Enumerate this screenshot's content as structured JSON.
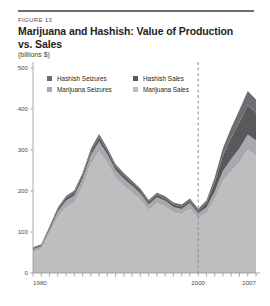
{
  "figure": {
    "label": "FIGURE 13",
    "title": "Marijuana and Hashish: Value of Production vs. Sales",
    "units": "(billions $)"
  },
  "legend": {
    "position": "top-left-inside",
    "items": [
      {
        "label": "Hashish Seizures",
        "color": "#6d6e71"
      },
      {
        "label": "Hashish Sales",
        "color": "#58595b"
      },
      {
        "label": "Marijuana Seizures",
        "color": "#a7a9ac"
      },
      {
        "label": "Marijuana Sales",
        "color": "#bcbec0"
      }
    ]
  },
  "axes": {
    "y_ticks": [
      "500",
      "400",
      "300",
      "200",
      "100",
      "0"
    ],
    "x_ticks": [
      "1980",
      "2000",
      "2007"
    ],
    "y_zero_label": "0"
  },
  "annotations": {
    "divider_year": 2000,
    "divider_style": "dashed"
  },
  "chart_data": {
    "type": "area",
    "title": "Marijuana and Hashish: Value of Production vs. Sales",
    "subtitle": "FIGURE 13",
    "xlabel": "",
    "ylabel": "billions $",
    "ylim": [
      0,
      500
    ],
    "xlim": [
      1980,
      2007
    ],
    "grid": false,
    "stacked": true,
    "legend_position": "top-left",
    "x": [
      1980,
      1981,
      1982,
      1983,
      1984,
      1985,
      1986,
      1987,
      1988,
      1989,
      1990,
      1991,
      1992,
      1993,
      1994,
      1995,
      1996,
      1997,
      1998,
      1999,
      2000,
      2001,
      2002,
      2003,
      2004,
      2005,
      2006,
      2007
    ],
    "series": [
      {
        "name": "Marijuana Sales",
        "color": "#bcbec0",
        "values": [
          52,
          58,
          96,
          137,
          160,
          172,
          211,
          265,
          297,
          268,
          232,
          212,
          196,
          178,
          153,
          170,
          162,
          148,
          143,
          157,
          134,
          146,
          180,
          224,
          248,
          270,
          300,
          287
        ]
      },
      {
        "name": "Marijuana Seizures",
        "color": "#a7a9ac",
        "values": [
          6,
          7,
          10,
          13,
          16,
          17,
          19,
          22,
          24,
          21,
          19,
          18,
          17,
          16,
          14,
          15,
          14,
          13,
          13,
          14,
          12,
          14,
          19,
          25,
          30,
          34,
          38,
          36
        ]
      },
      {
        "name": "Hashish Sales",
        "color": "#58595b",
        "values": [
          3,
          3,
          5,
          6,
          7,
          7,
          8,
          9,
          10,
          9,
          8,
          8,
          7,
          7,
          6,
          6,
          6,
          6,
          6,
          6,
          6,
          10,
          22,
          38,
          52,
          64,
          72,
          68
        ]
      },
      {
        "name": "Hashish Seizures",
        "color": "#6d6e71",
        "values": [
          2,
          2,
          3,
          4,
          5,
          5,
          6,
          7,
          8,
          7,
          6,
          6,
          5,
          5,
          5,
          5,
          5,
          5,
          5,
          5,
          5,
          7,
          12,
          18,
          24,
          30,
          34,
          32
        ]
      }
    ],
    "totals": [
      63,
      70,
      114,
      160,
      188,
      201,
      244,
      303,
      339,
      305,
      265,
      244,
      225,
      206,
      178,
      196,
      187,
      172,
      167,
      182,
      157,
      177,
      233,
      305,
      354,
      398,
      444,
      423
    ]
  }
}
